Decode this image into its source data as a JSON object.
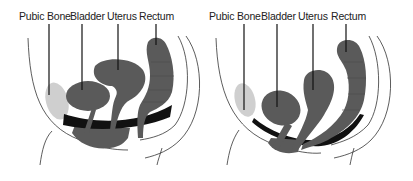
{
  "colors": {
    "organ": "#5a5a5a",
    "pubic_bone": "#cfcfcf",
    "pelvic_floor": "#111111",
    "outline": "#333333",
    "background": "#ffffff"
  },
  "diagrams": [
    {
      "id": "normal",
      "labels": [
        {
          "text": "Pubic Bone",
          "x": 19
        },
        {
          "text": "Bladder",
          "x": 70
        },
        {
          "text": "Uterus",
          "x": 107
        },
        {
          "text": "Rectum",
          "x": 139
        }
      ]
    },
    {
      "id": "prolapse",
      "labels": [
        {
          "text": "Pubic Bone",
          "x": 3
        },
        {
          "text": "Bladder",
          "x": 55
        },
        {
          "text": "Uterus",
          "x": 92
        },
        {
          "text": "Rectum",
          "x": 125
        }
      ]
    }
  ]
}
